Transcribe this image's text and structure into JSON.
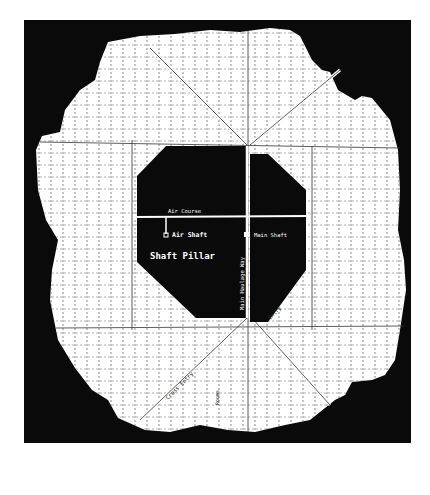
{
  "diagram": {
    "type": "mine-map",
    "colors": {
      "background": "#0a0a0a",
      "worked_area": "#ffffff",
      "shaft_pillar": "#0a0a0a",
      "dashed_lines": "#444444",
      "entries": "#ffffff"
    },
    "labels": {
      "shaft_pillar": "Shaft Pillar",
      "air_course": "Air Course",
      "air_shaft": "Air Shaft",
      "main_shaft": "Main Shaft",
      "main_haulage_way": "Main Haulage Way",
      "entry": "Entry",
      "cross_entry": "Cross Entry",
      "rooms": "Rooms"
    }
  }
}
